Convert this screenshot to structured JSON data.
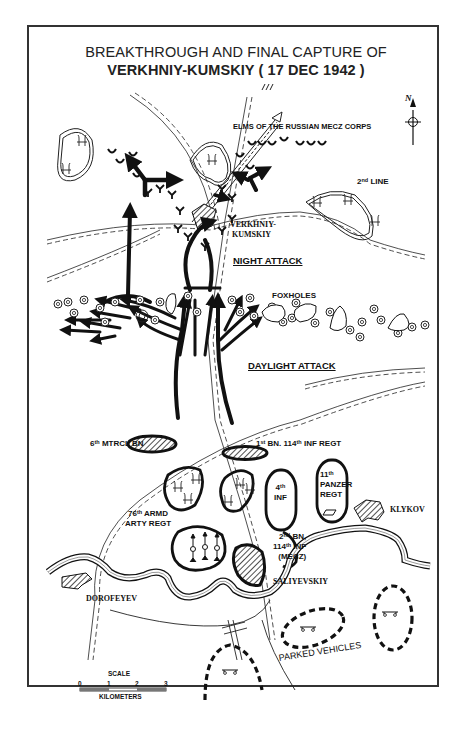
{
  "map": {
    "title_line1": "BREAKTHROUGH AND FINAL CAPTURE OF",
    "title_line2": "VERKHNIY-KUMSKIY ( 17 DEC 1942 )",
    "north_label": "N",
    "labels": {
      "mecz_corps": "ELMS OF THE RUSSIAN MECZ CORPS",
      "second_line_num": "2",
      "second_line_sup": "nd",
      "second_line_text": " LINE",
      "verkhniy_1": "VERKHNIY-",
      "verkhniy_2": "KUMSKIY",
      "night_attack": "NIGHT ATTACK",
      "foxholes": "FOXHOLES",
      "daylight_attack": "DAYLIGHT ATTACK",
      "mtrcl_num": "6",
      "mtrcl_sup": "th",
      "mtrcl_text": " MTRCL BN",
      "bn114_a": "1",
      "bn114_a_sup": "st",
      "bn114_b": " BN. 114",
      "bn114_b_sup": "th",
      "bn114_c": " INF REGT",
      "inf4_num": "4",
      "inf4_sup": "th",
      "inf4_text": "INF",
      "panzer_num": "11",
      "panzer_sup": "th",
      "panzer_l2": "PANZER",
      "panzer_l3": "REGT",
      "klykov": "KLYKOV",
      "armd_num": "76",
      "armd_sup": "th",
      "armd_text": " ARMD",
      "armd_l2": "ARTY REGT",
      "bn2_num": "2",
      "bn2_sup": "nd",
      "bn2_text": " BN,",
      "bn2_l2_num": "114",
      "bn2_l2_sup": "th",
      "bn2_l2_text": " INF",
      "bn2_l3": "(MECZ)",
      "saliyevskiy": "SALIYEVSKIY",
      "dorofeyev": "DOROFEYEV",
      "parked_vehicles": "PARKED VEHICLES"
    },
    "scale": {
      "title": "SCALE",
      "ticks": [
        "0",
        "1",
        "2",
        "3"
      ],
      "unit": "KILOMETERS"
    }
  }
}
